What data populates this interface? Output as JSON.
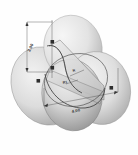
{
  "figure": {
    "background_color": "#fefefe",
    "style": "grayscale shaded 3D CAD isometric view",
    "outline_color": "#3a3a3a"
  },
  "solids": [
    {
      "name": "left-lobe",
      "label": "left ellipsoidal lobe",
      "fill_light": "#e6e6e6",
      "fill_dark": "#9a9a9a"
    },
    {
      "name": "upper-lobe",
      "label": "upper ellipsoidal lobe",
      "fill_light": "#ececec",
      "fill_dark": "#b4b4b4"
    },
    {
      "name": "right-lobe",
      "label": "right ellipsoidal lobe",
      "fill_light": "#e2e2e2",
      "fill_dark": "#a6a6a6"
    },
    {
      "name": "front-lobe",
      "label": "front ellipsoidal lobe",
      "fill_light": "#d8d8d8",
      "fill_dark": "#8e8e8e"
    }
  ],
  "dimensions": {
    "vertical_height": {
      "value": "2.00",
      "name": "vertical-height-dimension",
      "orientation": "vertical-left"
    },
    "base_width": {
      "value": "4.00",
      "name": "base-width-dimension",
      "orientation": "diagonal-front"
    },
    "radius_upper": {
      "value": "R",
      "name": "upper-radius-callout"
    },
    "radius_center": {
      "value": "R1",
      "name": "center-radius-callout"
    }
  },
  "markers": [
    {
      "name": "vertex-marker-top",
      "label": "■"
    },
    {
      "name": "vertex-marker-mid",
      "label": "■"
    },
    {
      "name": "vertex-marker-left",
      "label": "■"
    },
    {
      "name": "vertex-marker-right",
      "label": "■"
    }
  ]
}
